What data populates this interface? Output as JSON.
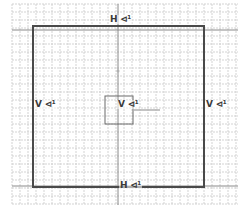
{
  "diagram": {
    "type": "grid-plan",
    "grid": {
      "spacing": 8,
      "origin_x": 12,
      "origin_y": 4,
      "color": "#c8c8c8",
      "style": "dotted"
    },
    "outer_rect": {
      "x": 33,
      "y": 26,
      "width": 171,
      "height": 161,
      "stroke": "#4a4a4a"
    },
    "center_rect": {
      "x": 105,
      "y": 96,
      "width": 28,
      "height": 28,
      "stroke": "#6a6a6a"
    },
    "guide_v": {
      "x": 118,
      "y1": 4,
      "y2": 205,
      "stroke": "#8a8a8a"
    },
    "guide_h": {
      "y": 30,
      "x1": 12,
      "x2": 238,
      "stroke": "#8a8a8a"
    },
    "guide_h_bottom": {
      "y": 186,
      "x1": 12,
      "x2": 238,
      "stroke": "#8a8a8a"
    },
    "stub": {
      "x1": 133,
      "y1": 110,
      "x2": 160,
      "y2": 110,
      "stroke": "#b0b0b0"
    },
    "dot": {
      "x": 118,
      "y": 71,
      "r": 1.5,
      "fill": "#b0b0b0"
    }
  },
  "labels": {
    "top": "H ⊲¹",
    "bottom": "H ⊲¹",
    "left": "V ⊲¹",
    "right": "V ⊲¹",
    "center": "V ⊲¹"
  }
}
